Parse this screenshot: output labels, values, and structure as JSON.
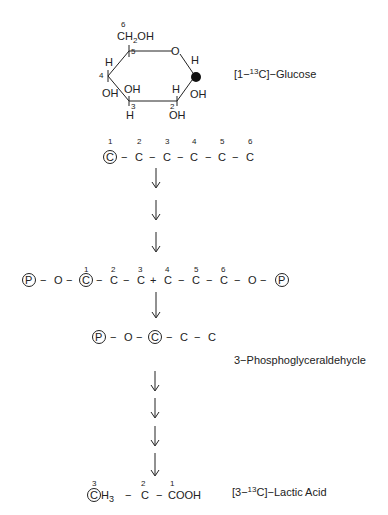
{
  "glucose": {
    "label_prefix": "[1−",
    "label_iso": "13",
    "label_suffix": "C]−Glucose",
    "ring": {
      "c6_num": "6",
      "c6_group": "CH",
      "c6_sub": "2",
      "c6_oh": "OH",
      "c5": "5",
      "o": "O",
      "c1_h": "H",
      "c1_oh": "OH",
      "c4": "4",
      "c4_h": "H",
      "c4_oh": "OH",
      "c3": "3",
      "c3_oh": "OH",
      "c3_h": "H",
      "c2": "2",
      "c2_h": "H",
      "c2_oh": "OH"
    }
  },
  "linear_chain": {
    "numbers": [
      "1",
      "2",
      "3",
      "4",
      "5",
      "6"
    ],
    "atoms": [
      "C",
      "C",
      "C",
      "C",
      "C",
      "C"
    ],
    "bond": "−",
    "labeled_index": 0
  },
  "fructose_bisphosphate": {
    "p": "P",
    "o": "O",
    "numbers": [
      "1",
      "2",
      "3",
      "4",
      "5",
      "6"
    ],
    "atoms": [
      "C",
      "C",
      "C",
      "C",
      "C",
      "C"
    ],
    "cleave": "+",
    "bond": "−"
  },
  "g3p": {
    "p": "P",
    "o": "O",
    "atoms": [
      "C",
      "C",
      "C"
    ],
    "bond": "−",
    "name": "3−Phosphoglyceraldehycle"
  },
  "lactic_acid": {
    "c3_num": "3",
    "c3": "C",
    "h3": "H",
    "h3_sub": "3",
    "c2_num": "2",
    "c2": "C",
    "c1_num": "1",
    "c1": "COOH",
    "bond": "−",
    "label_prefix": "[3−",
    "label_iso": "13",
    "label_suffix": "C]−Lactic Acid"
  },
  "arrows": {
    "upper_count": 3,
    "middle_count": 1,
    "lower_count": 4
  }
}
